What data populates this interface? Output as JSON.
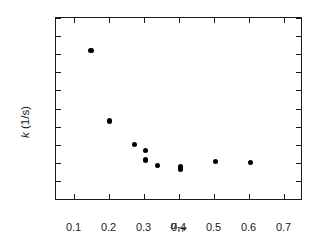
{
  "chart_data": {
    "type": "scatter",
    "title": "",
    "xlabel": "u_TP",
    "xlabel_base": "u",
    "xlabel_sub": "TP",
    "ylabel": "k (1/s)",
    "ylabel_base": "k",
    "ylabel_rest": " (1/s)",
    "xlim": [
      0.05,
      0.75
    ],
    "ylim": [
      0.4,
      1.4
    ],
    "xticks": [
      0.1,
      0.2,
      0.3,
      0.4,
      0.5,
      0.6,
      0.7
    ],
    "xtick_labels": [
      "0.1",
      "0.2",
      "0.3",
      "0.4",
      "0.5",
      "0.6",
      "0.7"
    ],
    "yticks": [
      0.4,
      0.5,
      0.6,
      0.7,
      0.8,
      0.9,
      1.0,
      1.1,
      1.2,
      1.3,
      1.4
    ],
    "ytick_labels": [
      "0.4",
      "0.5",
      "0.6",
      "0.7",
      "0.8",
      "0.9",
      "1",
      "1.1",
      "1.2",
      "1.3",
      "1.4"
    ],
    "grid": false,
    "legend": false,
    "marker": "filled-circle",
    "marker_color": "#000000",
    "axis_color": "#1a1a1a",
    "background": "#ffffff",
    "series": [
      {
        "name": "k vs u_TP",
        "points": [
          {
            "x": 0.15,
            "y": 1.22
          },
          {
            "x": 0.202,
            "y": 0.83
          },
          {
            "x": 0.275,
            "y": 0.7
          },
          {
            "x": 0.305,
            "y": 0.668
          },
          {
            "x": 0.305,
            "y": 0.616
          },
          {
            "x": 0.34,
            "y": 0.586
          },
          {
            "x": 0.405,
            "y": 0.578
          },
          {
            "x": 0.405,
            "y": 0.566
          },
          {
            "x": 0.505,
            "y": 0.608
          },
          {
            "x": 0.605,
            "y": 0.601
          }
        ]
      }
    ]
  }
}
